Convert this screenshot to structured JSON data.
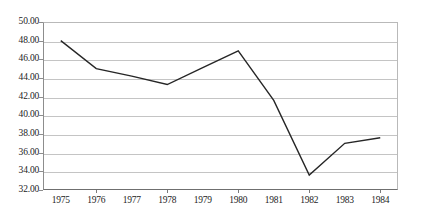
{
  "chart_data": {
    "type": "line",
    "title": "",
    "subtitle": "",
    "xlabel": "",
    "ylabel": "",
    "categories": [
      "1975",
      "1976",
      "1977",
      "1978",
      "1979",
      "1980",
      "1981",
      "1982",
      "1983",
      "1984"
    ],
    "values": [
      48.0,
      45.0,
      44.2,
      43.3,
      45.1,
      46.9,
      41.6,
      33.6,
      37.0,
      37.6
    ],
    "series": [
      {
        "name": "series-1",
        "values": [
          48.0,
          45.0,
          44.2,
          43.3,
          45.1,
          46.9,
          41.6,
          33.6,
          37.0,
          37.6
        ]
      }
    ],
    "ylim": [
      32.0,
      50.0
    ],
    "ytick_step": 2.0,
    "ytick_labels": [
      "50.00",
      "48.00",
      "46.00",
      "44.00",
      "42.00",
      "40.00",
      "38.00",
      "36.00",
      "34.00",
      "32.00"
    ],
    "ytick_values": [
      50.0,
      48.0,
      46.0,
      44.0,
      42.0,
      40.0,
      38.0,
      36.0,
      34.0,
      32.0
    ],
    "grid": true,
    "grid_axis": "y",
    "legend": false,
    "legend_position": "none",
    "markers": false,
    "line_color": "#262626",
    "grid_color": "#c4c4c4",
    "axis_color": "#6f6f6f",
    "text_color": "#1d1d1d",
    "background_color": "#ffffff"
  }
}
